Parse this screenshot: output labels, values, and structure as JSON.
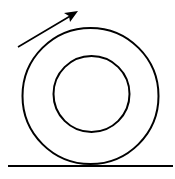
{
  "diagram": {
    "elements": {
      "outer_circle": {
        "cx": 90.5,
        "cy": 96,
        "r": 68
      },
      "inner_circle": {
        "cx": 91.5,
        "cy": 94,
        "r": 38
      },
      "ground_line": {
        "x1": 8,
        "y1": 166,
        "x2": 173,
        "y2": 166
      },
      "direction_arrow": {
        "x1": 18,
        "y1": 47,
        "x2": 77,
        "y2": 12
      }
    },
    "colors": {
      "stroke": "#000000",
      "background": "#ffffff"
    }
  }
}
